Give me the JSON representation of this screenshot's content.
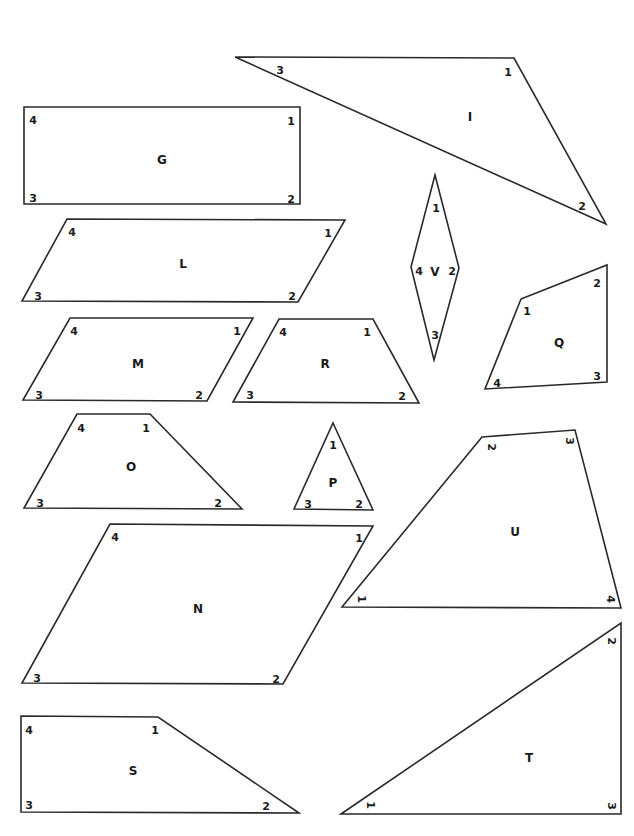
{
  "worksheet": {
    "shapes": [
      {
        "id": "I",
        "type": "triangle",
        "points": [
          [
            235,
            57
          ],
          [
            514,
            58
          ],
          [
            606,
            224
          ]
        ],
        "name_pos": [
          470,
          117
        ],
        "vertices": [
          {
            "label": "3",
            "pos": [
              280,
              71
            ],
            "rot": 0
          },
          {
            "label": "1",
            "pos": [
              508,
              73
            ],
            "rot": 0
          },
          {
            "label": "2",
            "pos": [
              582,
              207
            ],
            "rot": 0
          }
        ]
      },
      {
        "id": "G",
        "type": "rectangle",
        "points": [
          [
            24,
            107
          ],
          [
            300,
            107
          ],
          [
            300,
            204
          ],
          [
            24,
            204
          ]
        ],
        "name_pos": [
          162,
          160
        ],
        "vertices": [
          {
            "label": "4",
            "pos": [
              33,
              121
            ],
            "rot": 0
          },
          {
            "label": "1",
            "pos": [
              291,
              122
            ],
            "rot": 0
          },
          {
            "label": "3",
            "pos": [
              33,
              199
            ],
            "rot": 0
          },
          {
            "label": "2",
            "pos": [
              291,
              200
            ],
            "rot": 0
          }
        ]
      },
      {
        "id": "L",
        "type": "parallelogram",
        "points": [
          [
            67,
            219
          ],
          [
            345,
            220
          ],
          [
            298,
            302
          ],
          [
            22,
            301
          ]
        ],
        "name_pos": [
          183,
          264
        ],
        "vertices": [
          {
            "label": "4",
            "pos": [
              72,
              233
            ],
            "rot": 0
          },
          {
            "label": "1",
            "pos": [
              328,
              234
            ],
            "rot": 0
          },
          {
            "label": "3",
            "pos": [
              38,
              297
            ],
            "rot": 0
          },
          {
            "label": "2",
            "pos": [
              292,
              297
            ],
            "rot": 0
          }
        ]
      },
      {
        "id": "V",
        "type": "rhombus",
        "points": [
          [
            435,
            175
          ],
          [
            459,
            268
          ],
          [
            434,
            360
          ],
          [
            411,
            267
          ]
        ],
        "name_pos": [
          435,
          272
        ],
        "vertices": [
          {
            "label": "1",
            "pos": [
              436,
              209
            ],
            "rot": 0
          },
          {
            "label": "2",
            "pos": [
              452,
              272
            ],
            "rot": 0
          },
          {
            "label": "3",
            "pos": [
              435,
              336
            ],
            "rot": 0
          },
          {
            "label": "4",
            "pos": [
              419,
              272
            ],
            "rot": 0
          }
        ]
      },
      {
        "id": "M",
        "type": "parallelogram",
        "points": [
          [
            70,
            318
          ],
          [
            253,
            318
          ],
          [
            207,
            401
          ],
          [
            23,
            400
          ]
        ],
        "name_pos": [
          138,
          364
        ],
        "vertices": [
          {
            "label": "4",
            "pos": [
              74,
              332
            ],
            "rot": 0
          },
          {
            "label": "1",
            "pos": [
              237,
              332
            ],
            "rot": 0
          },
          {
            "label": "3",
            "pos": [
              39,
              396
            ],
            "rot": 0
          },
          {
            "label": "2",
            "pos": [
              199,
              396
            ],
            "rot": 0
          }
        ]
      },
      {
        "id": "R",
        "type": "trapezoid",
        "points": [
          [
            279,
            319
          ],
          [
            373,
            319
          ],
          [
            419,
            403
          ],
          [
            233,
            402
          ]
        ],
        "name_pos": [
          325,
          364
        ],
        "vertices": [
          {
            "label": "4",
            "pos": [
              283,
              333
            ],
            "rot": 0
          },
          {
            "label": "1",
            "pos": [
              367,
              333
            ],
            "rot": 0
          },
          {
            "label": "3",
            "pos": [
              250,
              396
            ],
            "rot": 0
          },
          {
            "label": "2",
            "pos": [
              402,
              397
            ],
            "rot": 0
          }
        ]
      },
      {
        "id": "Q",
        "type": "quadrilateral",
        "points": [
          [
            521,
            299
          ],
          [
            607,
            265
          ],
          [
            607,
            382
          ],
          [
            485,
            389
          ]
        ],
        "name_pos": [
          559,
          343
        ],
        "vertices": [
          {
            "label": "1",
            "pos": [
              527,
              312
            ],
            "rot": 0
          },
          {
            "label": "2",
            "pos": [
              597,
              284
            ],
            "rot": 0
          },
          {
            "label": "3",
            "pos": [
              597,
              377
            ],
            "rot": 0
          },
          {
            "label": "4",
            "pos": [
              497,
              384
            ],
            "rot": 0
          }
        ]
      },
      {
        "id": "O",
        "type": "trapezoid",
        "points": [
          [
            77,
            414
          ],
          [
            150,
            414
          ],
          [
            242,
            509
          ],
          [
            24,
            508
          ]
        ],
        "name_pos": [
          131,
          467
        ],
        "vertices": [
          {
            "label": "4",
            "pos": [
              81,
              429
            ],
            "rot": 0
          },
          {
            "label": "1",
            "pos": [
              146,
              429
            ],
            "rot": 0
          },
          {
            "label": "3",
            "pos": [
              40,
              504
            ],
            "rot": 0
          },
          {
            "label": "2",
            "pos": [
              218,
              504
            ],
            "rot": 0
          }
        ]
      },
      {
        "id": "P",
        "type": "triangle",
        "points": [
          [
            333,
            423
          ],
          [
            373,
            510
          ],
          [
            294,
            509
          ]
        ],
        "name_pos": [
          333,
          483
        ],
        "vertices": [
          {
            "label": "1",
            "pos": [
              333,
              446
            ],
            "rot": 0
          },
          {
            "label": "3",
            "pos": [
              308,
              505
            ],
            "rot": 0
          },
          {
            "label": "2",
            "pos": [
              359,
              505
            ],
            "rot": 0
          }
        ]
      },
      {
        "id": "U",
        "type": "quadrilateral",
        "points": [
          [
            482,
            437
          ],
          [
            575,
            430
          ],
          [
            621,
            608
          ],
          [
            342,
            607
          ]
        ],
        "name_pos": [
          515,
          532
        ],
        "vertices": [
          {
            "label": "2",
            "pos": [
              491,
              447
            ],
            "rot": 90
          },
          {
            "label": "3",
            "pos": [
              569,
              441
            ],
            "rot": 90
          },
          {
            "label": "4",
            "pos": [
              610,
              599
            ],
            "rot": 90
          },
          {
            "label": "1",
            "pos": [
              361,
              599
            ],
            "rot": 90
          }
        ]
      },
      {
        "id": "N",
        "type": "parallelogram",
        "points": [
          [
            110,
            524
          ],
          [
            373,
            526
          ],
          [
            283,
            684
          ],
          [
            22,
            683
          ]
        ],
        "name_pos": [
          198,
          609
        ],
        "vertices": [
          {
            "label": "4",
            "pos": [
              115,
              538
            ],
            "rot": 0
          },
          {
            "label": "1",
            "pos": [
              359,
              539
            ],
            "rot": 0
          },
          {
            "label": "3",
            "pos": [
              37,
              679
            ],
            "rot": 0
          },
          {
            "label": "2",
            "pos": [
              276,
              680
            ],
            "rot": 0
          }
        ]
      },
      {
        "id": "T",
        "type": "triangle",
        "points": [
          [
            341,
            814
          ],
          [
            621,
            623
          ],
          [
            621,
            814
          ]
        ],
        "name_pos": [
          529,
          758
        ],
        "vertices": [
          {
            "label": "1",
            "pos": [
              370,
              805
            ],
            "rot": 90
          },
          {
            "label": "2",
            "pos": [
              611,
              641
            ],
            "rot": 90
          },
          {
            "label": "3",
            "pos": [
              611,
              806
            ],
            "rot": 90
          }
        ]
      },
      {
        "id": "S",
        "type": "trapezoid",
        "points": [
          [
            21,
            716
          ],
          [
            158,
            717
          ],
          [
            299,
            813
          ],
          [
            21,
            812
          ]
        ],
        "name_pos": [
          133,
          771
        ],
        "vertices": [
          {
            "label": "4",
            "pos": [
              29,
              731
            ],
            "rot": 0
          },
          {
            "label": "1",
            "pos": [
              155,
              731
            ],
            "rot": 0
          },
          {
            "label": "3",
            "pos": [
              29,
              806
            ],
            "rot": 0
          },
          {
            "label": "2",
            "pos": [
              266,
              807
            ],
            "rot": 0
          }
        ]
      }
    ]
  }
}
